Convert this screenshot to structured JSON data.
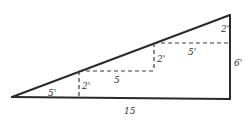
{
  "diagram": {
    "colors": {
      "line": "#2a2a2a",
      "dashed": "#3a3a3a",
      "text": "#333333",
      "background": "#ffffff"
    },
    "points": {
      "apex_left": [
        12,
        97
      ],
      "bottom_right": [
        230,
        99
      ],
      "top_right": [
        230,
        15
      ],
      "step1": [
        79,
        71
      ],
      "step2": [
        154,
        43
      ]
    },
    "labels": {
      "bottom_run_1": "5'",
      "rise_1": "2'",
      "middle_run": "5",
      "rise_2": "2'",
      "top_run": "5'",
      "rise_3": "2'",
      "right_height": "6'",
      "base_length": "15"
    }
  }
}
